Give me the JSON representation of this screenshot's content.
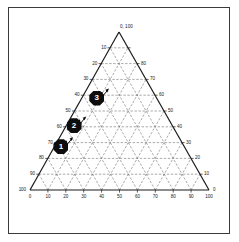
{
  "figure": {
    "kind": "ternary-diagram",
    "background_color": "#ffffff",
    "frame_color": "#3a3a3a",
    "axis_color": "#1a1a1a",
    "grid_color": "#6e6e6e",
    "marker_fill": "#0d0d0d",
    "marker_text_color": "#ffffff"
  },
  "chart_data": {
    "type": "scatter",
    "title": "",
    "subtitle": "",
    "xlabel": "",
    "ylabel": "",
    "grid": true,
    "grid_style": "dashed",
    "legend_position": "none",
    "ternary": true,
    "axis_range": [
      0,
      100
    ],
    "tick_step": 10,
    "apex_label": "0, 100",
    "bottom_axis_ticks": [
      "0",
      "10",
      "20",
      "30",
      "40",
      "50",
      "60",
      "70",
      "80",
      "90",
      "100"
    ],
    "left_axis_ticks": [
      "100",
      "90",
      "80",
      "70",
      "60",
      "50",
      "40",
      "30",
      "20",
      "10"
    ],
    "right_axis_ticks": [
      "80",
      "70",
      "60",
      "50",
      "40",
      "30",
      "20",
      "10",
      "0"
    ],
    "left_axis_tick_values": [
      100,
      90,
      80,
      70,
      60,
      50,
      40,
      30,
      20,
      10
    ],
    "right_axis_tick_values": [
      80,
      70,
      60,
      50,
      40,
      30,
      20,
      10,
      0
    ],
    "bottom_axis_tick_values": [
      0,
      10,
      20,
      30,
      40,
      50,
      60,
      70,
      80,
      90,
      100
    ],
    "points": [
      {
        "id": "1",
        "label": "1",
        "x_frac": 0.255,
        "y_frac": 0.606,
        "bottom": 25,
        "left": 61,
        "right": 14
      },
      {
        "id": "2",
        "label": "2",
        "x_frac": 0.31,
        "y_frac": 0.52,
        "bottom": 31,
        "left": 52,
        "right": 17
      },
      {
        "id": "3",
        "label": "3",
        "x_frac": 0.405,
        "y_frac": 0.405,
        "bottom": 40,
        "left": 40,
        "right": 20
      }
    ],
    "annotations": [
      {
        "kind": "arrow",
        "target": "1"
      },
      {
        "kind": "arrow",
        "target": "2"
      },
      {
        "kind": "arrow",
        "target": "3"
      }
    ]
  }
}
